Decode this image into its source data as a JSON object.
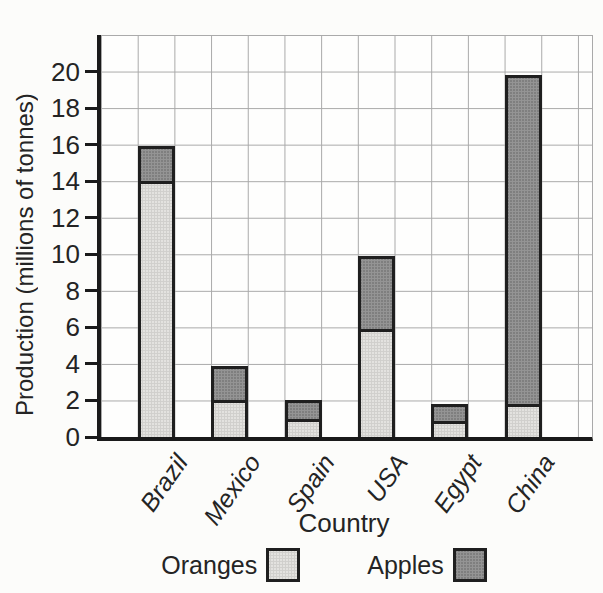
{
  "page": {
    "background": "#fcfcfa"
  },
  "chart_data": {
    "type": "bar",
    "stacked": true,
    "title": "",
    "categories": [
      "Brazil",
      "Mexico",
      "Spain",
      "USA",
      "Egypt",
      "China"
    ],
    "series": [
      {
        "name": "Oranges",
        "values": [
          14,
          2,
          1,
          5.9,
          0.9,
          1.8
        ],
        "color": "#e3e2df"
      },
      {
        "name": "Apples",
        "values": [
          1.9,
          1.9,
          1,
          4,
          0.9,
          18
        ],
        "color": "#7f7f7f"
      }
    ],
    "totals": [
      15.9,
      3.9,
      2,
      9.9,
      1.8,
      19.8
    ],
    "xlabel": "Country",
    "ylabel": "Production (millions of tonnes)",
    "ylim": [
      0,
      22
    ],
    "ytick_step": 2,
    "ytick_labels": [
      "0",
      "2",
      "4",
      "6",
      "8",
      "10",
      "12",
      "14",
      "16",
      "18",
      "20"
    ],
    "grid": true,
    "legend_position": "bottom"
  },
  "colors": {
    "bar_border": "#1f1f1f",
    "axis": "#1a1a1a",
    "grid": "#a9a9a9",
    "text": "#242424",
    "oranges_fill": "#e3e2df",
    "apples_fill": "#7f7f7f"
  }
}
